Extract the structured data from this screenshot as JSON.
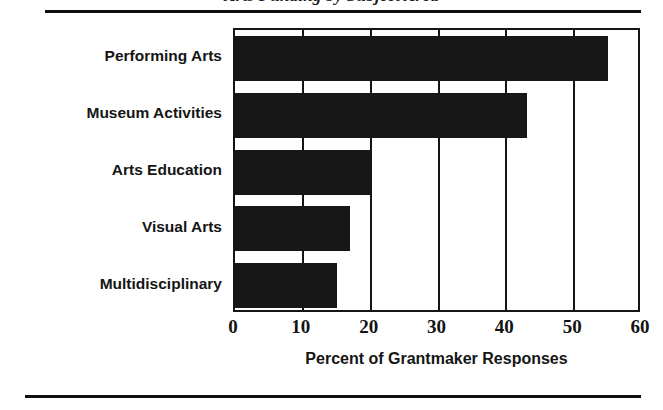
{
  "figure": {
    "title": "Arts Funding by Subject Area",
    "title_visible_note": "clipped at top edge of screenshot"
  },
  "chart_data": {
    "type": "bar",
    "orientation": "horizontal",
    "title": "Arts Funding by Subject Area",
    "xlabel": "Percent of Grantmaker Responses",
    "ylabel": "",
    "categories": [
      "Performing Arts",
      "Museum Activities",
      "Arts Education",
      "Visual Arts",
      "Multidisciplinary"
    ],
    "values": [
      55,
      43,
      20,
      17,
      15
    ],
    "xlim": [
      0,
      60
    ],
    "xticks": [
      0,
      10,
      20,
      30,
      40,
      50,
      60
    ],
    "xtick_labels": [
      "0",
      "10",
      "20",
      "30",
      "40",
      "50",
      "60"
    ],
    "grid": "vertical",
    "legend": null,
    "bar_color": "#171717",
    "frame_color": "#151515",
    "background": "#ffffff"
  },
  "axis": {
    "x_title": "Percent of Grantmaker Responses",
    "ticks": [
      "0",
      "10",
      "20",
      "30",
      "40",
      "50",
      "60"
    ]
  },
  "colors": {
    "bar": "#171717",
    "frame": "#151515",
    "rule": "#101010",
    "text": "#151515",
    "background": "#ffffff"
  }
}
